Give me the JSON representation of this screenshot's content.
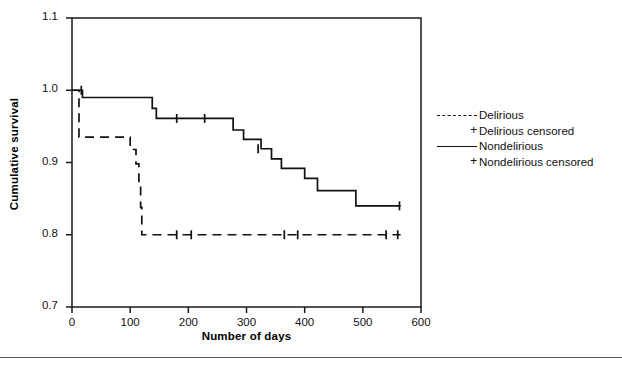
{
  "chart_data": {
    "type": "line",
    "title": "",
    "xlabel": "Number of days",
    "ylabel": "Cumulative survival",
    "xlim": [
      0,
      600
    ],
    "ylim": [
      0.7,
      1.1
    ],
    "xticks": [
      0,
      100,
      200,
      300,
      400,
      500,
      600
    ],
    "yticks": [
      0.7,
      0.8,
      0.9,
      1.0,
      1.1
    ],
    "xticklabels": [
      "0",
      "100",
      "200",
      "300",
      "400",
      "500",
      "600"
    ],
    "yticklabels": [
      "0.7",
      "0.8",
      "0.9",
      "1.0",
      "1.1"
    ],
    "grid": false,
    "legend_position": "right",
    "series": [
      {
        "name": "Delirious",
        "style": "dashed",
        "color": "#111111",
        "points": [
          [
            0,
            1.0
          ],
          [
            12,
            1.0
          ],
          [
            12,
            0.935
          ],
          [
            100,
            0.935
          ],
          [
            100,
            0.918
          ],
          [
            110,
            0.918
          ],
          [
            110,
            0.898
          ],
          [
            115,
            0.898
          ],
          [
            115,
            0.868
          ],
          [
            118,
            0.868
          ],
          [
            118,
            0.838
          ],
          [
            120,
            0.838
          ],
          [
            120,
            0.8
          ],
          [
            565,
            0.8
          ]
        ],
        "censored_marker": "+",
        "censored_x": [
          180,
          205,
          365,
          388,
          540,
          560
        ],
        "censored_y": [
          0.8,
          0.8,
          0.8,
          0.8,
          0.8,
          0.8
        ]
      },
      {
        "name": "Nondelirious",
        "style": "solid",
        "color": "#111111",
        "points": [
          [
            0,
            1.0
          ],
          [
            18,
            1.0
          ],
          [
            18,
            0.99
          ],
          [
            138,
            0.99
          ],
          [
            138,
            0.975
          ],
          [
            145,
            0.975
          ],
          [
            145,
            0.961
          ],
          [
            277,
            0.961
          ],
          [
            277,
            0.945
          ],
          [
            295,
            0.945
          ],
          [
            295,
            0.932
          ],
          [
            325,
            0.932
          ],
          [
            325,
            0.919
          ],
          [
            343,
            0.919
          ],
          [
            343,
            0.905
          ],
          [
            360,
            0.905
          ],
          [
            360,
            0.892
          ],
          [
            400,
            0.892
          ],
          [
            400,
            0.878
          ],
          [
            422,
            0.878
          ],
          [
            422,
            0.861
          ],
          [
            488,
            0.861
          ],
          [
            488,
            0.84
          ],
          [
            565,
            0.84
          ]
        ],
        "censored_marker": "+",
        "censored_x": [
          16,
          180,
          228,
          320,
          563
        ],
        "censored_y": [
          1.0,
          0.961,
          0.961,
          0.919,
          0.84
        ]
      }
    ],
    "legend": [
      {
        "label": "Delirious",
        "key": "dashed-line"
      },
      {
        "label": "Delirious censored",
        "key": "plus-marker"
      },
      {
        "label": "Nondelirious",
        "key": "solid-line"
      },
      {
        "label": "Nondelirious censored",
        "key": "plus-marker"
      }
    ]
  }
}
